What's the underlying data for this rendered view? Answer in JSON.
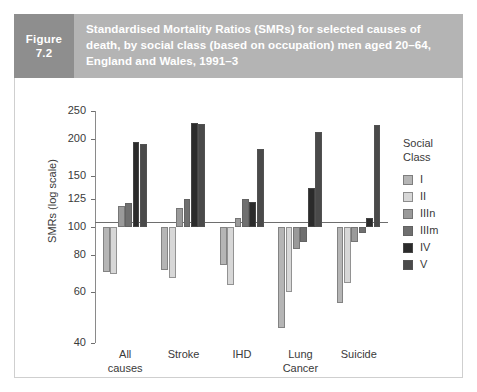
{
  "figure": {
    "tag_word": "Figure",
    "tag_number": "7.2",
    "title": "Standardised Mortality Ratios (SMRs) for selected causes of death, by social class (based on occupation) men aged 20–64, England and Wales, 1991–3"
  },
  "colors": {
    "tag_bg": "#8e8e8e",
    "title_bg": "#b4b4b4",
    "title_text": "#ffffff",
    "panel_bg": "#ffffff",
    "axis": "#6e6e6e",
    "text": "#3a3a3a",
    "class_I": "#b5b5b5",
    "class_II": "#d7d7d7",
    "class_IIIn": "#9a9a9a",
    "class_IIIm": "#6f6f6f",
    "class_IV": "#2b2b2b",
    "class_V": "#4a4a4a"
  },
  "legend": {
    "title_line1": "Social",
    "title_line2": "Class",
    "items": [
      {
        "label": "I",
        "color": "#b5b5b5"
      },
      {
        "label": "II",
        "color": "#d7d7d7"
      },
      {
        "label": "IIIn",
        "color": "#9a9a9a"
      },
      {
        "label": "IIIm",
        "color": "#6f6f6f"
      },
      {
        "label": "IV",
        "color": "#2b2b2b"
      },
      {
        "label": "V",
        "color": "#4a4a4a"
      }
    ]
  },
  "chart_data": {
    "type": "bar",
    "title": "Standardised Mortality Ratios (SMRs) for selected causes of death, by social class (based on occupation) men aged 20–64, England and Wales, 1991–3",
    "xlabel": "",
    "ylabel": "SMRs (log scale)",
    "yscale": "log",
    "ylim": [
      40,
      250
    ],
    "baseline": 100,
    "grid": false,
    "legend_position": "right",
    "yticks": [
      250,
      200,
      150,
      125,
      100,
      80,
      60,
      40
    ],
    "ytick_labels": [
      "250",
      "200",
      "150",
      "125",
      "100",
      "80",
      "60",
      "40"
    ],
    "categories": [
      "All causes",
      "Stroke",
      "IHD",
      "Lung Cancer",
      "Suicide"
    ],
    "category_lines": [
      [
        "All",
        "causes"
      ],
      [
        "Stroke",
        ""
      ],
      [
        "IHD",
        ""
      ],
      [
        "Lung",
        "Cancer"
      ],
      [
        "Suicide",
        ""
      ]
    ],
    "series": [
      {
        "name": "I",
        "color": "#b5b5b5",
        "values": [
          70,
          71,
          74,
          45,
          55
        ]
      },
      {
        "name": "II",
        "color": "#d7d7d7",
        "values": [
          69,
          67,
          63,
          60,
          64
        ]
      },
      {
        "name": "IIIn",
        "color": "#9a9a9a",
        "values": [
          118,
          116,
          107,
          84,
          89
        ]
      },
      {
        "name": "IIIm",
        "color": "#6f6f6f",
        "values": [
          121,
          125,
          125,
          89,
          95
        ]
      },
      {
        "name": "IV",
        "color": "#2b2b2b",
        "values": [
          195,
          227,
          122,
          136,
          107
        ]
      },
      {
        "name": "V",
        "color": "#4a4a4a",
        "values": [
          193,
          225,
          185,
          211,
          223
        ]
      }
    ]
  }
}
